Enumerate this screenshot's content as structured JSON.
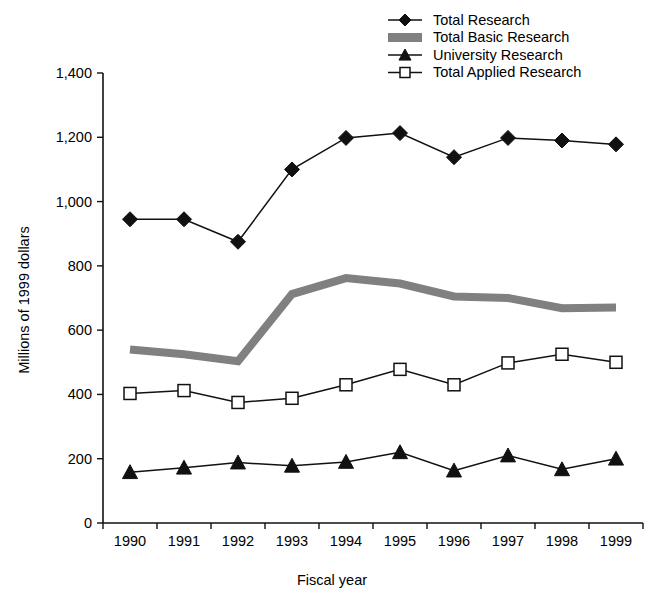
{
  "chart_data": {
    "type": "line",
    "title": "",
    "xlabel": "Fiscal year",
    "ylabel": "Millions of 1999 dollars",
    "categories": [
      "1990",
      "1991",
      "1992",
      "1993",
      "1994",
      "1995",
      "1996",
      "1997",
      "1998",
      "1999"
    ],
    "x": [
      1990,
      1991,
      1992,
      1993,
      1994,
      1995,
      1996,
      1997,
      1998,
      1999
    ],
    "xlim": [
      1989.5,
      1999.5
    ],
    "ylim": [
      0,
      1400
    ],
    "y_ticks": [
      0,
      200,
      400,
      600,
      800,
      1000,
      1200,
      1400
    ],
    "y_tick_labels": [
      "0",
      "200",
      "400",
      "600",
      "800",
      "1,000",
      "1,200",
      "1,400"
    ],
    "grid": false,
    "legend_position": "top-right",
    "series": [
      {
        "name": "Total Research",
        "marker": "diamond",
        "color": "#111111",
        "values": [
          945,
          945,
          875,
          1100,
          1198,
          1213,
          1138,
          1198,
          1190,
          1178
        ]
      },
      {
        "name": "Total Basic Research",
        "marker": "band",
        "color": "#808080",
        "values": [
          540,
          525,
          503,
          712,
          762,
          745,
          705,
          700,
          668,
          670
        ]
      },
      {
        "name": "University Research",
        "marker": "triangle",
        "color": "#111111",
        "values": [
          158,
          172,
          188,
          178,
          190,
          220,
          163,
          210,
          167,
          200
        ]
      },
      {
        "name": "Total Applied Research",
        "marker": "square",
        "color": "#111111",
        "values": [
          403,
          412,
          375,
          388,
          430,
          478,
          430,
          498,
          525,
          500
        ]
      }
    ]
  },
  "legend": {
    "items": [
      {
        "label": "Total Research",
        "marker": "diamond"
      },
      {
        "label": "Total Basic Research",
        "marker": "band"
      },
      {
        "label": "University Research",
        "marker": "triangle"
      },
      {
        "label": "Total Applied Research",
        "marker": "square"
      }
    ]
  },
  "axes": {
    "y_title": "Millions of 1999 dollars",
    "x_title": "Fiscal year"
  }
}
